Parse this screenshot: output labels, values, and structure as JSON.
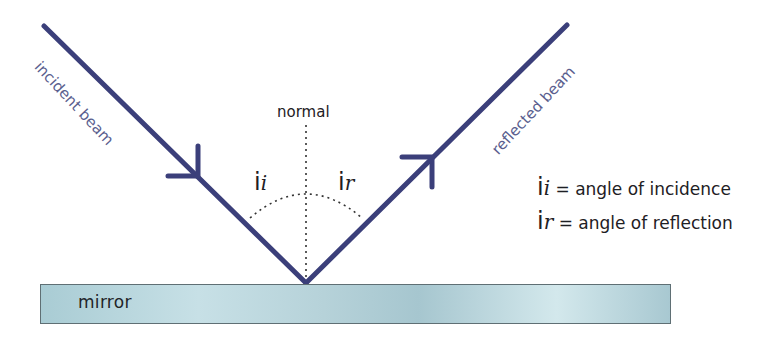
{
  "diagram": {
    "labels": {
      "incident_beam": "incident beam",
      "reflected_beam": "reflected beam",
      "normal": "normal",
      "mirror": "mirror"
    },
    "angles": {
      "incidence": {
        "symbol": "i",
        "subscript": "i"
      },
      "reflection": {
        "symbol": "i",
        "subscript": "r"
      }
    },
    "legend": [
      {
        "symbol": "i",
        "subscript": "i",
        "text": " = angle of incidence"
      },
      {
        "symbol": "i",
        "subscript": "r",
        "text": " = angle of reflection"
      }
    ],
    "colors": {
      "beam": "#3b3f7a",
      "beam_label": "#5a5e8e",
      "mirror": "#b6d2d9",
      "text": "#1e2024"
    }
  }
}
